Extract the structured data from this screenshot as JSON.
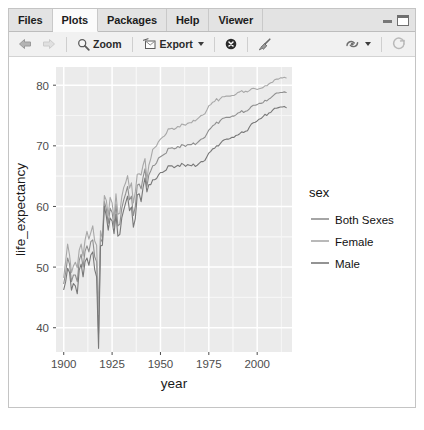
{
  "window": {
    "minimize_label": "Minimize",
    "maximize_label": "Maximize"
  },
  "tabs": [
    {
      "label": "Files",
      "active": false
    },
    {
      "label": "Plots",
      "active": true
    },
    {
      "label": "Packages",
      "active": false
    },
    {
      "label": "Help",
      "active": false
    },
    {
      "label": "Viewer",
      "active": false
    }
  ],
  "toolbar": {
    "back_label": "Previous Plot",
    "forward_label": "Next Plot",
    "zoom_label": "Zoom",
    "export_label": "Export",
    "remove_label": "Remove current plot",
    "clear_all_label": "Clear all plots",
    "publish_label": "Publish",
    "refresh_label": "Refresh current plot"
  },
  "colors": {
    "panel_bg": "#ebebeb",
    "grid_major": "#ffffff",
    "grid_minor": "#f6f6f6",
    "axis_text": "#4d4d4d",
    "axis_title": "#1a1a1a",
    "series_both": "#8f8f8f",
    "series_female": "#a8a8a8",
    "series_male": "#787878"
  },
  "chart_data": {
    "type": "line",
    "title": "",
    "xlabel": "year",
    "ylabel": "life_expectancy",
    "xlim": [
      1896,
      2018
    ],
    "ylim": [
      36,
      83
    ],
    "xticks": [
      1900,
      1925,
      1950,
      1975,
      2000
    ],
    "yticks": [
      40,
      50,
      60,
      70,
      80
    ],
    "grid": true,
    "legend": {
      "title": "sex",
      "position": "right",
      "entries": [
        "Both Sexes",
        "Female",
        "Male"
      ]
    },
    "x": [
      1900,
      1901,
      1902,
      1903,
      1904,
      1905,
      1906,
      1907,
      1908,
      1909,
      1910,
      1911,
      1912,
      1913,
      1914,
      1915,
      1916,
      1917,
      1918,
      1919,
      1920,
      1921,
      1922,
      1923,
      1924,
      1925,
      1926,
      1927,
      1928,
      1929,
      1930,
      1931,
      1932,
      1933,
      1934,
      1935,
      1936,
      1937,
      1938,
      1939,
      1940,
      1941,
      1942,
      1943,
      1944,
      1945,
      1946,
      1947,
      1948,
      1949,
      1950,
      1951,
      1952,
      1953,
      1954,
      1955,
      1956,
      1957,
      1958,
      1959,
      1960,
      1961,
      1962,
      1963,
      1964,
      1965,
      1966,
      1967,
      1968,
      1969,
      1970,
      1971,
      1972,
      1973,
      1974,
      1975,
      1976,
      1977,
      1978,
      1979,
      1980,
      1981,
      1982,
      1983,
      1984,
      1985,
      1986,
      1987,
      1988,
      1989,
      1990,
      1991,
      1992,
      1993,
      1994,
      1995,
      1996,
      1997,
      1998,
      1999,
      2000,
      2001,
      2002,
      2003,
      2004,
      2005,
      2006,
      2007,
      2008,
      2009,
      2010,
      2011,
      2012,
      2013,
      2014,
      2015
    ],
    "series": [
      {
        "name": "Both Sexes",
        "values": [
          47.3,
          49.1,
          51.5,
          50.5,
          47.6,
          48.7,
          48.7,
          47.6,
          51.1,
          52.1,
          50.0,
          52.6,
          53.5,
          52.5,
          54.2,
          54.5,
          51.7,
          50.9,
          39.1,
          54.7,
          54.1,
          60.8,
          59.6,
          57.2,
          59.7,
          59.0,
          56.7,
          60.4,
          56.8,
          57.1,
          59.7,
          61.1,
          62.1,
          63.3,
          61.1,
          61.7,
          58.5,
          60.0,
          63.5,
          63.7,
          62.9,
          64.8,
          66.2,
          63.3,
          65.2,
          65.9,
          66.7,
          66.8,
          67.2,
          68.0,
          68.2,
          68.4,
          68.6,
          68.8,
          69.6,
          69.6,
          69.7,
          69.5,
          69.6,
          69.9,
          69.7,
          70.2,
          70.1,
          69.9,
          70.2,
          70.2,
          70.2,
          70.5,
          70.2,
          70.5,
          70.8,
          71.1,
          71.2,
          71.4,
          72.0,
          72.6,
          72.9,
          73.3,
          73.5,
          73.9,
          73.7,
          74.2,
          74.5,
          74.6,
          74.7,
          74.7,
          74.7,
          74.9,
          74.9,
          75.1,
          75.4,
          75.5,
          75.8,
          75.5,
          75.7,
          75.8,
          76.1,
          76.5,
          76.7,
          76.7,
          76.8,
          77.0,
          77.0,
          77.1,
          77.5,
          77.4,
          77.7,
          77.9,
          78.2,
          78.5,
          78.7,
          78.7,
          78.8,
          78.8,
          78.9,
          78.8
        ]
      },
      {
        "name": "Female",
        "values": [
          48.3,
          51.0,
          53.8,
          52.0,
          49.1,
          50.2,
          50.8,
          49.9,
          52.8,
          53.8,
          51.8,
          54.4,
          55.9,
          54.6,
          55.7,
          56.8,
          54.3,
          53.6,
          42.2,
          56.0,
          54.6,
          61.8,
          61.0,
          58.5,
          61.5,
          60.6,
          58.0,
          62.1,
          58.7,
          58.9,
          61.6,
          63.1,
          63.9,
          65.1,
          63.0,
          63.9,
          60.6,
          62.4,
          65.3,
          65.4,
          65.2,
          66.8,
          67.9,
          64.4,
          66.8,
          67.9,
          69.4,
          69.7,
          70.0,
          70.7,
          71.1,
          71.4,
          71.6,
          72.0,
          72.8,
          72.8,
          72.9,
          72.7,
          72.9,
          73.2,
          73.1,
          73.6,
          73.5,
          73.4,
          73.7,
          73.8,
          73.8,
          74.2,
          74.1,
          74.4,
          74.7,
          75.0,
          75.1,
          75.3,
          75.9,
          76.6,
          76.8,
          77.2,
          77.3,
          77.8,
          77.4,
          77.8,
          78.1,
          78.1,
          78.2,
          78.2,
          78.2,
          78.3,
          78.3,
          78.5,
          78.8,
          78.9,
          79.1,
          78.8,
          79.0,
          78.9,
          79.1,
          79.4,
          79.5,
          79.4,
          79.3,
          79.4,
          79.5,
          79.6,
          79.9,
          79.9,
          80.2,
          80.4,
          80.5,
          80.9,
          81.0,
          81.0,
          81.2,
          81.2,
          81.3,
          81.2
        ]
      },
      {
        "name": "Male",
        "values": [
          46.3,
          47.6,
          49.8,
          49.1,
          46.2,
          47.3,
          46.9,
          45.6,
          49.5,
          50.5,
          48.4,
          50.9,
          51.5,
          50.3,
          52.0,
          52.5,
          49.6,
          48.4,
          36.6,
          53.5,
          53.6,
          60.0,
          58.4,
          56.1,
          58.1,
          57.6,
          55.5,
          58.7,
          55.1,
          55.4,
          58.1,
          59.4,
          60.6,
          61.7,
          59.3,
          59.9,
          56.6,
          58.0,
          61.9,
          62.1,
          60.8,
          63.1,
          64.7,
          62.4,
          63.6,
          63.6,
          64.4,
          64.4,
          64.6,
          65.2,
          65.6,
          65.6,
          65.8,
          66.0,
          66.7,
          66.7,
          66.7,
          66.4,
          66.6,
          66.8,
          66.6,
          67.1,
          66.9,
          66.6,
          66.9,
          66.8,
          66.7,
          67.0,
          66.6,
          66.8,
          67.1,
          67.4,
          67.4,
          67.6,
          68.2,
          68.8,
          69.1,
          69.5,
          69.6,
          70.0,
          70.0,
          70.4,
          70.8,
          71.0,
          71.1,
          71.1,
          71.2,
          71.4,
          71.4,
          71.7,
          71.8,
          72.0,
          72.3,
          72.2,
          72.4,
          72.5,
          73.1,
          73.6,
          73.8,
          73.9,
          74.1,
          74.4,
          74.5,
          74.8,
          75.2,
          75.0,
          75.4,
          75.5,
          75.9,
          76.2,
          76.2,
          76.3,
          76.4,
          76.4,
          76.5,
          76.3
        ]
      }
    ]
  }
}
